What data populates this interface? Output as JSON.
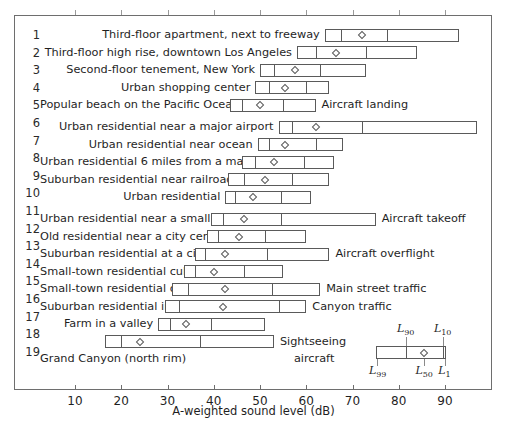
{
  "chart_data": {
    "type": "bar",
    "subtype": "percentile-range-bar",
    "title": "",
    "xlabel": "A-weighted sound level (dB)",
    "ylabel": "",
    "xlim": [
      6,
      96
    ],
    "xticks": [
      10,
      20,
      30,
      40,
      50,
      60,
      70,
      80,
      90
    ],
    "xticklabels": [
      "10",
      "20",
      "30",
      "40",
      "50",
      "60",
      "70",
      "80",
      "90"
    ],
    "grid": false,
    "legend_position": "inside-lower-right",
    "percentile_scheme": [
      "L99",
      "L90",
      "L50",
      "L10",
      "L1"
    ],
    "categories": [
      "Third-floor apartment, next to freeway",
      "Third-floor high rise, downtown Los Angeles",
      "Second-floor tenement, New York",
      "Urban shopping center",
      "Popular beach on the Pacific Ocean",
      "Urban residential near a major airport",
      "Urban residential near ocean",
      "Urban residential 6 miles from a major airport",
      "Suburban residential near railroad tracks",
      "Urban residential",
      "Urban residential near a small airport",
      "Old residential near a city center",
      "Suburban residential at a city outskirts",
      "Small-town residential cul-de-sac",
      "Small-town residential on a main street",
      "Suburban residential in a hill canyon",
      "Farm in a valley",
      "Grand Canyon (north rim)"
    ],
    "rows": [
      {
        "num": "1",
        "label": "Third-floor apartment, next to freeway",
        "note": "",
        "L99": 64.0,
        "L90": 67.5,
        "L50": 72.0,
        "L10": 77.5,
        "L1": 93.0
      },
      {
        "num": "2",
        "label": "Third-floor high rise, downtown Los Angeles",
        "note": "",
        "L99": 58.0,
        "L90": 62.0,
        "L50": 66.5,
        "L10": 73.0,
        "L1": 84.0
      },
      {
        "num": "3",
        "label": "Second-floor tenement, New York",
        "note": "",
        "L99": 50.0,
        "L90": 53.0,
        "L50": 57.5,
        "L10": 63.0,
        "L1": 73.0
      },
      {
        "num": "4",
        "label": "Urban shopping center",
        "note": "",
        "L99": 49.0,
        "L90": 52.0,
        "L50": 55.5,
        "L10": 60.0,
        "L1": 65.0
      },
      {
        "num": "5",
        "label": "Popular beach on the Pacific Ocean",
        "note": "Aircraft landing",
        "L99": 43.5,
        "L90": 46.0,
        "L50": 50.0,
        "L10": 55.0,
        "L1": 62.0
      },
      {
        "num": "6",
        "label": "Urban residential near a major airport",
        "note": "",
        "L99": 54.0,
        "L90": 57.0,
        "L50": 62.0,
        "L10": 72.0,
        "L1": 97.0
      },
      {
        "num": "7",
        "label": "Urban residential near ocean",
        "note": "",
        "L99": 49.5,
        "L90": 52.0,
        "L50": 55.5,
        "L10": 62.0,
        "L1": 68.0
      },
      {
        "num": "8",
        "label": "Urban residential 6 miles from a major airport",
        "note": "",
        "L99": 46.0,
        "L90": 49.0,
        "L50": 53.0,
        "L10": 59.5,
        "L1": 66.0
      },
      {
        "num": "9",
        "label": "Suburban residential near railroad tracks",
        "note": "",
        "L99": 43.0,
        "L90": 46.5,
        "L50": 51.0,
        "L10": 57.0,
        "L1": 65.0
      },
      {
        "num": "10",
        "label": "Urban residential",
        "note": "",
        "L99": 42.5,
        "L90": 44.5,
        "L50": 48.5,
        "L10": 54.5,
        "L1": 61.0
      },
      {
        "num": "11",
        "label": "Urban residential near a small airport",
        "note": "Aircraft takeoff",
        "L99": 39.5,
        "L90": 42.0,
        "L50": 46.5,
        "L10": 54.5,
        "L1": 75.0
      },
      {
        "num": "12",
        "label": "Old residential near a city center",
        "note": "",
        "L99": 38.5,
        "L90": 41.0,
        "L50": 45.5,
        "L10": 51.0,
        "L1": 60.0
      },
      {
        "num": "13",
        "label": "Suburban residential at a city outskirts",
        "note": "Aircraft overflight",
        "L99": 36.0,
        "L90": 38.0,
        "L50": 42.5,
        "L10": 51.5,
        "L1": 65.0
      },
      {
        "num": "14",
        "label": "Small-town residential cul-de-sac",
        "note": "",
        "L99": 33.5,
        "L90": 36.0,
        "L50": 40.0,
        "L10": 46.5,
        "L1": 55.0
      },
      {
        "num": "15",
        "label": "Small-town residential on a main street",
        "note": "Main street traffic",
        "L99": 31.0,
        "L90": 34.5,
        "L50": 42.5,
        "L10": 52.5,
        "L1": 63.0
      },
      {
        "num": "16",
        "label": "Suburban residential in a hill canyon",
        "note": "Canyon traffic",
        "L99": 29.5,
        "L90": 32.5,
        "L50": 42.0,
        "L10": 54.0,
        "L1": 60.0
      },
      {
        "num": "17",
        "label": "Farm in a valley",
        "note": "",
        "L99": 28.0,
        "L90": 30.5,
        "L50": 34.0,
        "L10": 39.5,
        "L1": 51.0
      },
      {
        "num": "18",
        "label": "Grand Canyon (north rim)",
        "note": "Sightseeing aircraft",
        "L99": 16.5,
        "L90": 20.0,
        "L50": 24.0,
        "L10": 37.0,
        "L1": 53.0
      }
    ],
    "row_numbers": [
      "1",
      "2",
      "3",
      "4",
      "5",
      "6",
      "7",
      "8",
      "9",
      "10",
      "11",
      "12",
      "13",
      "14",
      "15",
      "16",
      "17",
      "18",
      "19"
    ],
    "notes": [
      {
        "text": "Aircraft landing",
        "row": 5
      },
      {
        "text": "Aircraft takeoff",
        "row": 11
      },
      {
        "text": "Aircraft overflight",
        "row": 13
      },
      {
        "text": "Main street traffic",
        "row": 15
      },
      {
        "text": "Canyon traffic",
        "row": 16
      },
      {
        "text": "Sightseeing",
        "row": 18
      },
      {
        "text": "aircraft",
        "row": 19
      }
    ],
    "legend": {
      "L99": "L99",
      "L90": "L90",
      "L50": "L50",
      "L10": "L10",
      "L1": "L1",
      "box_left_db": 75.0,
      "box_d1_db": 81.5,
      "box_median_db": 85.5,
      "box_d2_db": 89.5,
      "box_right_db": 90.3
    },
    "colors": {
      "frame": "#6e6e6e",
      "box_stroke": "#5a5a5a",
      "box_fill": "#ffffff",
      "text": "#1f1f1f",
      "background": "#ffffff"
    }
  },
  "axis": {
    "title": "A-weighted sound level (dB)"
  }
}
